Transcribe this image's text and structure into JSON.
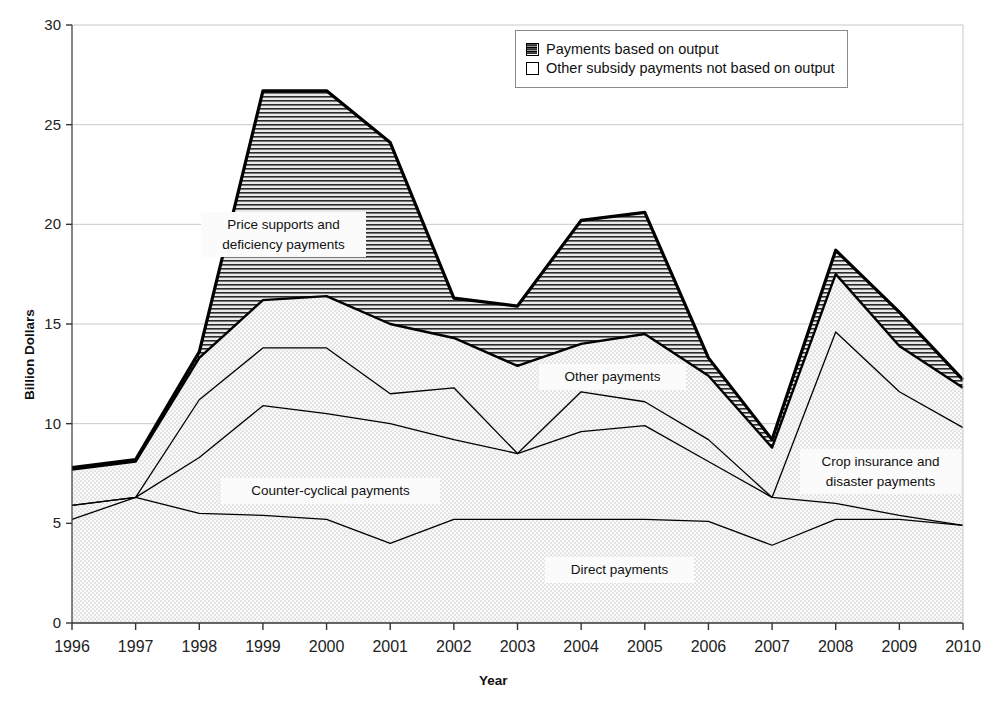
{
  "chart_data": {
    "type": "area",
    "title": "",
    "xlabel": "Year",
    "ylabel": "Billion Dollars",
    "categories": [
      1996,
      1997,
      1998,
      1999,
      2000,
      2001,
      2002,
      2003,
      2004,
      2005,
      2006,
      2007,
      2008,
      2009,
      2010
    ],
    "x": [
      "1996",
      "1997",
      "1998",
      "1999",
      "2000",
      "2001",
      "2002",
      "2003",
      "2004",
      "2005",
      "2006",
      "2007",
      "2008",
      "2009",
      "2010"
    ],
    "xlim": [
      1996,
      2010
    ],
    "ylim": [
      0,
      30
    ],
    "yticks": [
      0,
      5,
      10,
      15,
      20,
      25,
      30
    ],
    "ytick_labels": [
      "0",
      "5",
      "10",
      "15",
      "20",
      "25",
      "30"
    ],
    "grid": true,
    "stacked": true,
    "legend_position": "top-right",
    "series": [
      {
        "name": "Direct payments",
        "fill": "dots",
        "cumulative": [
          5.2,
          6.3,
          5.5,
          5.4,
          5.2,
          4.0,
          5.2,
          5.2,
          5.2,
          5.2,
          5.1,
          3.9,
          5.2,
          5.2,
          4.9
        ],
        "values": [
          5.2,
          6.3,
          5.5,
          5.4,
          5.2,
          4.0,
          5.2,
          5.2,
          5.2,
          5.2,
          5.1,
          3.9,
          5.2,
          5.2,
          4.9
        ]
      },
      {
        "name": "Counter-cyclical payments",
        "fill": "dots",
        "cumulative": [
          5.9,
          6.3,
          8.3,
          10.9,
          10.5,
          10.0,
          9.2,
          8.5,
          9.6,
          9.9,
          8.1,
          6.3,
          6.0,
          5.4,
          4.9
        ],
        "values": [
          0.7,
          0.0,
          2.8,
          5.5,
          5.3,
          6.0,
          4.0,
          3.3,
          4.4,
          4.7,
          3.0,
          2.4,
          0.8,
          0.2,
          0.0
        ]
      },
      {
        "name": "Crop insurance and disaster payments",
        "fill": "dots",
        "cumulative": [
          5.9,
          6.3,
          11.2,
          13.8,
          13.8,
          11.5,
          11.8,
          8.5,
          11.6,
          11.1,
          9.2,
          6.3,
          14.6,
          11.6,
          9.8
        ],
        "values": [
          0.0,
          0.0,
          2.9,
          2.9,
          3.3,
          1.5,
          2.6,
          0.0,
          2.0,
          1.2,
          1.1,
          0.0,
          8.6,
          6.2,
          4.9
        ]
      },
      {
        "name": "Other payments",
        "fill": "dots",
        "cumulative": [
          7.7,
          8.1,
          13.3,
          16.2,
          16.4,
          15.0,
          14.3,
          12.9,
          14.0,
          14.5,
          12.4,
          8.8,
          17.5,
          13.9,
          11.8
        ],
        "values": [
          1.8,
          1.8,
          2.1,
          2.4,
          2.6,
          3.5,
          2.5,
          4.4,
          2.4,
          3.4,
          3.2,
          2.5,
          2.9,
          2.3,
          2.0
        ]
      },
      {
        "name": "Price supports and deficiency payments",
        "fill": "horizontal-lines",
        "cumulative": [
          7.8,
          8.2,
          13.6,
          26.7,
          26.7,
          24.1,
          16.3,
          15.9,
          20.2,
          20.6,
          13.3,
          9.2,
          18.7,
          15.6,
          12.2
        ],
        "values": [
          0.1,
          0.1,
          0.3,
          10.5,
          10.3,
          9.1,
          2.0,
          3.0,
          6.2,
          6.1,
          0.9,
          0.4,
          1.2,
          1.7,
          0.4
        ]
      }
    ],
    "annotations": [
      {
        "id": "price-supports",
        "text": "Price supports and\ndeficiency payments",
        "x": 201,
        "y": 212,
        "w": 151,
        "h": 42
      },
      {
        "id": "other-payments",
        "text": "Other payments",
        "x": 539,
        "y": 364,
        "w": 133,
        "h": 22
      },
      {
        "id": "counter-cyclical",
        "text": "Counter-cyclical payments",
        "x": 221,
        "y": 478,
        "w": 205,
        "h": 22
      },
      {
        "id": "crop-insurance",
        "text": "Crop insurance and\ndisaster payments",
        "x": 800,
        "y": 449,
        "w": 147,
        "h": 42
      },
      {
        "id": "direct-payments",
        "text": "Direct payments",
        "x": 545,
        "y": 557,
        "w": 135,
        "h": 22
      }
    ],
    "legend": {
      "entries": [
        {
          "label": "Payments based on output",
          "pattern": "horizontal-lines"
        },
        {
          "label": "Other subsidy payments not based on output",
          "pattern": "dots"
        }
      ]
    }
  },
  "colors": {
    "line": "#000000",
    "grid": "#c9c9c9",
    "axis": "#333333",
    "dots_fill": "#f4f4f4",
    "hatch_fill": "#d9d9d9",
    "background": "#ffffff",
    "legend_border": "#8a8a8a"
  }
}
